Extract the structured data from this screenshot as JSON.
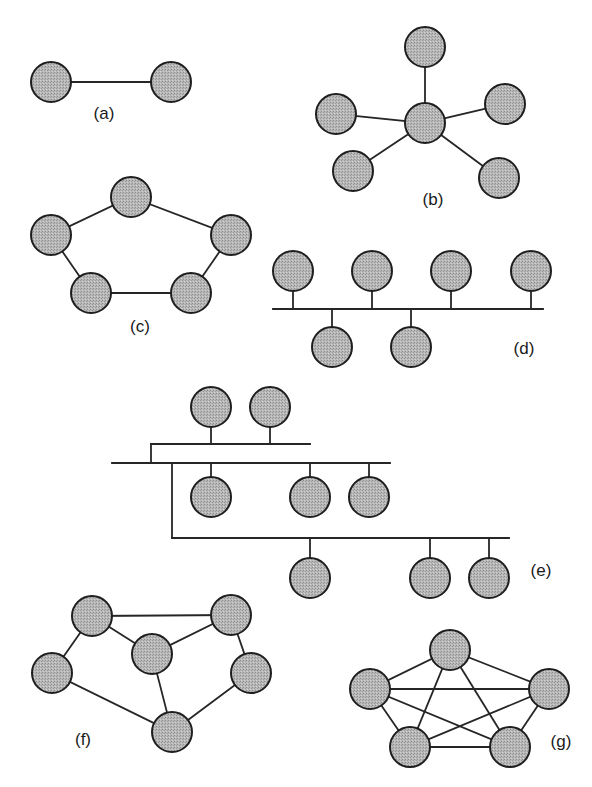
{
  "diagram": {
    "node_radius": 20,
    "colors": {
      "node_fill": "#b3b3b3",
      "node_stroke": "#1e1e1e",
      "edge": "#262626",
      "label": "#1a1a1a",
      "background": "#ffffff"
    },
    "panels": [
      {
        "id": "a",
        "label": "(a)",
        "label_pos": [
          104,
          115
        ],
        "type": "point-to-point",
        "nodes": [
          [
            51,
            82
          ],
          [
            171,
            82
          ]
        ],
        "edges": [
          [
            0,
            1
          ]
        ]
      },
      {
        "id": "b",
        "label": "(b)",
        "label_pos": [
          433,
          201
        ],
        "type": "star",
        "nodes": [
          [
            425,
            47
          ],
          [
            336,
            114
          ],
          [
            425,
            123
          ],
          [
            505,
            104
          ],
          [
            353,
            171
          ],
          [
            499,
            178
          ]
        ],
        "edges": [
          [
            2,
            0
          ],
          [
            2,
            1
          ],
          [
            2,
            3
          ],
          [
            2,
            4
          ],
          [
            2,
            5
          ]
        ]
      },
      {
        "id": "c",
        "label": "(c)",
        "label_pos": [
          140,
          328
        ],
        "type": "ring",
        "nodes": [
          [
            131,
            197
          ],
          [
            51,
            235
          ],
          [
            231,
            235
          ],
          [
            91,
            293
          ],
          [
            191,
            293
          ]
        ],
        "edges": [
          [
            0,
            1
          ],
          [
            0,
            2
          ],
          [
            1,
            3
          ],
          [
            2,
            4
          ],
          [
            3,
            4
          ]
        ]
      },
      {
        "id": "d",
        "label": "(d)",
        "label_pos": [
          524,
          350
        ],
        "type": "bus",
        "nodes": [
          [
            293,
            271
          ],
          [
            372,
            271
          ],
          [
            451,
            271
          ],
          [
            531,
            271
          ],
          [
            332,
            347
          ],
          [
            411,
            347
          ]
        ],
        "lines": [
          [
            273,
            309,
            543,
            309
          ],
          [
            293,
            291,
            293,
            309
          ],
          [
            372,
            291,
            372,
            309
          ],
          [
            451,
            291,
            451,
            309
          ],
          [
            531,
            291,
            531,
            309
          ],
          [
            332,
            309,
            332,
            327
          ],
          [
            411,
            309,
            411,
            327
          ]
        ]
      },
      {
        "id": "e",
        "label": "(e)",
        "label_pos": [
          541,
          572
        ],
        "type": "tree",
        "nodes": [
          [
            211,
            407
          ],
          [
            270,
            407
          ],
          [
            211,
            497
          ],
          [
            310,
            497
          ],
          [
            369,
            497
          ],
          [
            310,
            578
          ],
          [
            430,
            578
          ],
          [
            489,
            578
          ]
        ],
        "lines": [
          [
            151,
            444,
            310,
            444
          ],
          [
            211,
            427,
            211,
            444
          ],
          [
            270,
            427,
            270,
            444
          ],
          [
            151,
            444,
            151,
            463
          ],
          [
            112,
            463,
            390,
            463
          ],
          [
            211,
            463,
            211,
            477
          ],
          [
            310,
            463,
            310,
            477
          ],
          [
            369,
            463,
            369,
            477
          ],
          [
            172,
            463,
            172,
            538
          ],
          [
            172,
            538,
            509,
            538
          ],
          [
            310,
            538,
            310,
            558
          ],
          [
            430,
            538,
            430,
            558
          ],
          [
            489,
            538,
            489,
            558
          ]
        ]
      },
      {
        "id": "f",
        "label": "(f)",
        "label_pos": [
          83,
          741
        ],
        "type": "mesh",
        "nodes": [
          [
            92,
            616
          ],
          [
            231,
            615
          ],
          [
            152,
            654
          ],
          [
            52,
            673
          ],
          [
            251,
            673
          ],
          [
            172,
            732
          ]
        ],
        "edges": [
          [
            0,
            1
          ],
          [
            0,
            2
          ],
          [
            0,
            3
          ],
          [
            1,
            2
          ],
          [
            1,
            4
          ],
          [
            2,
            5
          ],
          [
            3,
            5
          ],
          [
            4,
            5
          ]
        ]
      },
      {
        "id": "g",
        "label": "(g)",
        "label_pos": [
          561,
          743
        ],
        "type": "fully-connected",
        "nodes": [
          [
            450,
            650
          ],
          [
            370,
            689
          ],
          [
            549,
            689
          ],
          [
            410,
            747
          ],
          [
            510,
            747
          ]
        ],
        "edges": [
          [
            0,
            1
          ],
          [
            0,
            2
          ],
          [
            0,
            3
          ],
          [
            0,
            4
          ],
          [
            1,
            2
          ],
          [
            1,
            3
          ],
          [
            1,
            4
          ],
          [
            2,
            3
          ],
          [
            2,
            4
          ],
          [
            3,
            4
          ]
        ]
      }
    ]
  }
}
